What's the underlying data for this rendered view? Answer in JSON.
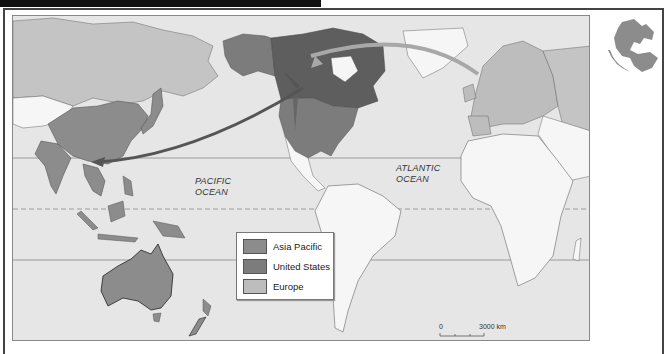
{
  "map": {
    "oceans": [
      {
        "id": "pacific",
        "line1": "PACIFIC",
        "line2": "OCEAN"
      },
      {
        "id": "atlantic",
        "line1": "ATLANTIC",
        "line2": "OCEAN"
      }
    ],
    "legend": {
      "items": [
        {
          "label": "Asia Pacific",
          "color": "#8c8c8c"
        },
        {
          "label": "United States",
          "color": "#7c7c7c"
        },
        {
          "label": "Europe",
          "color": "#bdbdbd"
        }
      ]
    },
    "scale_bar": {
      "start": "0",
      "end": "3000 km"
    },
    "colors": {
      "ocean": "#e6e6e6",
      "land": "#f6f6f6",
      "asia_pacific": "#8c8c8c",
      "united_states": "#7c7c7c",
      "canada": "#5e5e5e",
      "europe": "#bdbdbd",
      "russia": "#c4c4c4",
      "arrow_dark": "#555555",
      "arrow_light": "#a8a8a8"
    }
  },
  "globe_icon": {
    "name": "globe-icon"
  }
}
